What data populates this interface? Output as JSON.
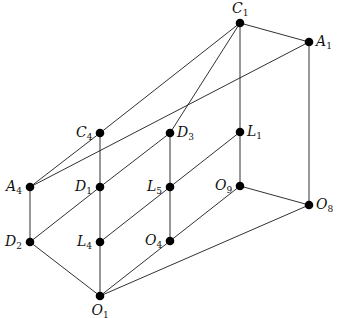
{
  "diagram": {
    "type": "lattice",
    "colors": {
      "edge": "#1a1a1a",
      "node": "#000000",
      "background": "#ffffff"
    },
    "nodes": [
      {
        "id": "C1",
        "letter": "C",
        "index": "1",
        "x": 240,
        "y": 23,
        "label_pos": "above"
      },
      {
        "id": "A1",
        "letter": "A",
        "index": "1",
        "x": 309,
        "y": 42,
        "label_pos": "right"
      },
      {
        "id": "C4",
        "letter": "C",
        "index": "4",
        "x": 100,
        "y": 133,
        "label_pos": "left"
      },
      {
        "id": "D3",
        "letter": "D",
        "index": "3",
        "x": 170,
        "y": 133,
        "label_pos": "right"
      },
      {
        "id": "L1",
        "letter": "L",
        "index": "1",
        "x": 240,
        "y": 132,
        "label_pos": "right"
      },
      {
        "id": "A4",
        "letter": "A",
        "index": "4",
        "x": 30,
        "y": 187,
        "label_pos": "left"
      },
      {
        "id": "D1",
        "letter": "D",
        "index": "1",
        "x": 100,
        "y": 187,
        "label_pos": "left"
      },
      {
        "id": "L5",
        "letter": "L",
        "index": "5",
        "x": 170,
        "y": 187,
        "label_pos": "left"
      },
      {
        "id": "O9",
        "letter": "O",
        "index": "9",
        "x": 240,
        "y": 186,
        "label_pos": "left"
      },
      {
        "id": "O8",
        "letter": "O",
        "index": "8",
        "x": 309,
        "y": 205,
        "label_pos": "right"
      },
      {
        "id": "D2",
        "letter": "D",
        "index": "2",
        "x": 30,
        "y": 242,
        "label_pos": "left"
      },
      {
        "id": "L4",
        "letter": "L",
        "index": "4",
        "x": 100,
        "y": 242,
        "label_pos": "left"
      },
      {
        "id": "O4",
        "letter": "O",
        "index": "4",
        "x": 170,
        "y": 241,
        "label_pos": "left"
      },
      {
        "id": "O1",
        "letter": "O",
        "index": "1",
        "x": 100,
        "y": 296,
        "label_pos": "below"
      }
    ],
    "edges": [
      [
        "C1",
        "A1"
      ],
      [
        "C1",
        "C4"
      ],
      [
        "C1",
        "D3"
      ],
      [
        "C1",
        "L1"
      ],
      [
        "A1",
        "A4"
      ],
      [
        "A1",
        "O8"
      ],
      [
        "C4",
        "A4"
      ],
      [
        "C4",
        "D1"
      ],
      [
        "D3",
        "D1"
      ],
      [
        "D3",
        "L5"
      ],
      [
        "L1",
        "L5"
      ],
      [
        "L1",
        "O9"
      ],
      [
        "A4",
        "D2"
      ],
      [
        "D1",
        "D2"
      ],
      [
        "D1",
        "L4"
      ],
      [
        "L5",
        "L4"
      ],
      [
        "L5",
        "O4"
      ],
      [
        "O9",
        "O4"
      ],
      [
        "O9",
        "O8"
      ],
      [
        "D2",
        "O1"
      ],
      [
        "L4",
        "O1"
      ],
      [
        "O4",
        "O1"
      ],
      [
        "O8",
        "O1"
      ]
    ]
  }
}
